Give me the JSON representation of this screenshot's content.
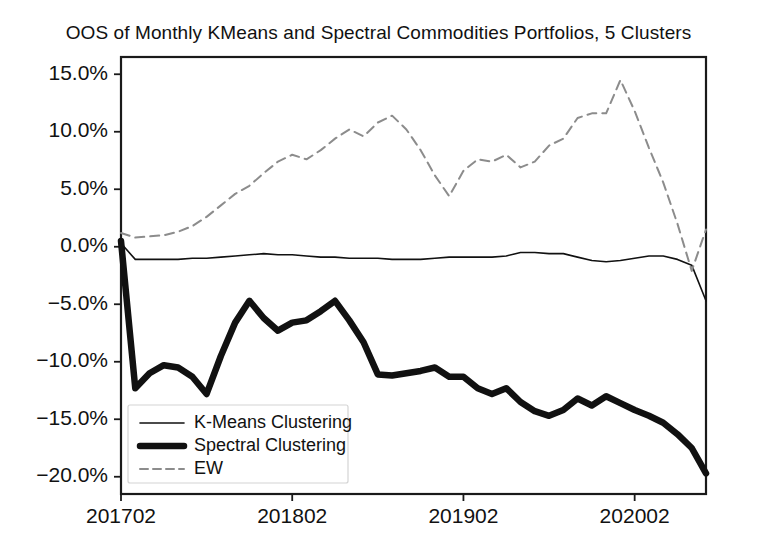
{
  "chart_data": {
    "type": "line",
    "title": "OOS of Monthly KMeans and Spectral Commodities Portfolios, 5 Clusters",
    "xlabel": "",
    "ylabel": "",
    "grid": false,
    "legend_position": "lower left",
    "xlim": [
      0,
      41
    ],
    "ylim": [
      -21.5,
      16.5
    ],
    "yticks": [
      15,
      10,
      5,
      0,
      -5,
      -10,
      -15,
      -20
    ],
    "ytick_labels": [
      "15.0%",
      "10.0%",
      "5.0%",
      "0.0%",
      "−5.0%",
      "−10.0%",
      "−15.0%",
      "−20.0%"
    ],
    "xticks": [
      0,
      12,
      24,
      36
    ],
    "xtick_labels": [
      "201702",
      "201802",
      "201902",
      "202002"
    ],
    "x": [
      0,
      1,
      2,
      3,
      4,
      5,
      6,
      7,
      8,
      9,
      10,
      11,
      12,
      13,
      14,
      15,
      16,
      17,
      18,
      19,
      20,
      21,
      22,
      23,
      24,
      25,
      26,
      27,
      28,
      29,
      30,
      31,
      32,
      33,
      34,
      35,
      36,
      37,
      38,
      39,
      40,
      41
    ],
    "series": [
      {
        "name": "K-Means Clustering",
        "style": "solid-thin",
        "color": "#111111",
        "linewidth": 1.6,
        "values": [
          0.3,
          -1.1,
          -1.1,
          -1.1,
          -1.1,
          -1.0,
          -1.0,
          -0.9,
          -0.8,
          -0.7,
          -0.6,
          -0.7,
          -0.7,
          -0.8,
          -0.9,
          -0.9,
          -1.0,
          -1.0,
          -1.0,
          -1.1,
          -1.1,
          -1.1,
          -1.0,
          -0.9,
          -0.9,
          -0.9,
          -0.9,
          -0.8,
          -0.5,
          -0.5,
          -0.6,
          -0.6,
          -0.9,
          -1.2,
          -1.3,
          -1.2,
          -1.0,
          -0.8,
          -0.8,
          -1.1,
          -1.6,
          -4.7
        ]
      },
      {
        "name": "Spectral Clustering",
        "style": "solid-thick",
        "color": "#111111",
        "linewidth": 6.5,
        "values": [
          0.5,
          -12.3,
          -11.0,
          -10.3,
          -10.5,
          -11.3,
          -12.8,
          -9.5,
          -6.6,
          -4.7,
          -6.2,
          -7.3,
          -6.6,
          -6.4,
          -5.6,
          -4.7,
          -6.4,
          -8.3,
          -11.1,
          -11.2,
          -11.0,
          -10.8,
          -10.5,
          -11.3,
          -11.3,
          -12.3,
          -12.8,
          -12.3,
          -13.5,
          -14.3,
          -14.7,
          -14.2,
          -13.2,
          -13.8,
          -13.0,
          -13.6,
          -14.2,
          -14.7,
          -15.3,
          -16.3,
          -17.5,
          -19.7
        ]
      },
      {
        "name": "EW",
        "style": "dashed",
        "color": "#8c8c8c",
        "linewidth": 2.0,
        "values": [
          1.2,
          0.8,
          0.9,
          1.0,
          1.3,
          1.8,
          2.6,
          3.6,
          4.6,
          5.3,
          6.4,
          7.4,
          8.0,
          7.6,
          8.4,
          9.4,
          10.2,
          9.6,
          10.8,
          11.4,
          10.2,
          8.4,
          6.2,
          4.4,
          6.6,
          7.6,
          7.4,
          8.0,
          6.9,
          7.4,
          8.8,
          9.4,
          11.2,
          11.6,
          11.6,
          14.5,
          11.8,
          8.6,
          5.6,
          2.0,
          -2.1,
          1.5
        ]
      }
    ]
  },
  "legend": {
    "entries": [
      {
        "label": "K-Means Clustering"
      },
      {
        "label": "Spectral Clustering"
      },
      {
        "label": "EW"
      }
    ]
  },
  "colors": {
    "axis": "#1a1a1a",
    "text": "#111111",
    "series_primary": "#111111",
    "series_ew": "#8c8c8c",
    "background": "#ffffff"
  }
}
